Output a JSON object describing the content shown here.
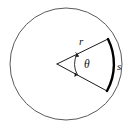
{
  "figure": {
    "type": "geometry-diagram",
    "background_color": "#ffffff",
    "labels": {
      "radius": "r",
      "angle": "θ",
      "arc": "s"
    },
    "colors": {
      "circle_outline": "#5a5a5a",
      "sector_lines": "#1a1a1a",
      "bold_arc": "#000000",
      "angle_marker": "#1a1a1a",
      "label_text": "#111111"
    },
    "geometry": {
      "circle": {
        "center_x": 66,
        "center_y": 64,
        "radius": 56,
        "stroke_width": 1
      },
      "sector": {
        "vertex_x": 57,
        "vertex_y": 64,
        "upper_endpoint_x": 108,
        "upper_endpoint_y": 39,
        "lower_endpoint_x": 107,
        "lower_endpoint_y": 91,
        "stroke_width": 1
      },
      "bold_arc": {
        "start_x": 108,
        "start_y": 39,
        "end_x": 107,
        "end_y": 91,
        "stroke_width": 2.4
      },
      "angle_marker": {
        "center_x": 57,
        "center_y": 64,
        "radius": 22,
        "has_arrowheads": true
      }
    }
  }
}
